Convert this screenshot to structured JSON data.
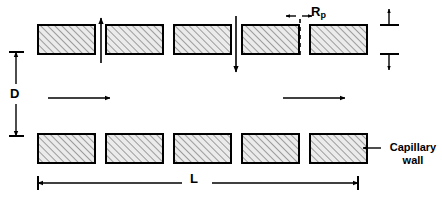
{
  "figure": {
    "type": "schematic-diagram",
    "background_color": "#ffffff",
    "line_color": "#000000",
    "cell_fill_color": "#e8e8e8",
    "hatch_color": "#555555"
  },
  "labels": {
    "diameter": "D",
    "length": "L",
    "pore_radius": "R",
    "pore_radius_subscript": "p",
    "thickness": "t",
    "capillary_wall_line1": "Capillary",
    "capillary_wall_line2": "wall"
  },
  "rows": {
    "top": {
      "name": "upper capillary wall",
      "cell_count": 5,
      "y": 25,
      "height": 29
    },
    "bottom": {
      "name": "lower capillary wall",
      "cell_count": 5,
      "y": 134,
      "height": 29
    }
  },
  "cells": {
    "x_positions": [
      38,
      106,
      174,
      242,
      310
    ],
    "width": 57,
    "count_per_row": 5
  },
  "annotations": {
    "flow_arrows": [
      {
        "name": "flow-arrow-left",
        "direction": "right",
        "x1": 48,
        "y1": 98,
        "x2": 110,
        "y2": 98
      },
      {
        "name": "flow-arrow-right",
        "direction": "right",
        "x1": 283,
        "y1": 98,
        "x2": 345,
        "y2": 98
      }
    ],
    "pore_arrows": [
      {
        "name": "pore-arrow-up",
        "direction": "up",
        "x": 101,
        "y1": 63,
        "y2": 18
      },
      {
        "name": "pore-arrow-down",
        "direction": "down",
        "x": 236,
        "y1": 16,
        "y2": 72
      }
    ],
    "dimension_D": {
      "x": 16,
      "y_top": 52,
      "y_bottom": 136
    },
    "dimension_L": {
      "y": 183,
      "x_left": 38,
      "x_right": 358
    },
    "dimension_t": {
      "x": 389,
      "y_top": 14,
      "y_bottom": 60
    },
    "pore_gap": {
      "x_left": 290,
      "x_right": 308,
      "y": 16
    },
    "dashed_pore_line": {
      "x": 299,
      "y_top": 20,
      "y_bottom": 56
    },
    "wall_pointer": {
      "x1": 380,
      "x2": 362,
      "y": 148
    }
  }
}
